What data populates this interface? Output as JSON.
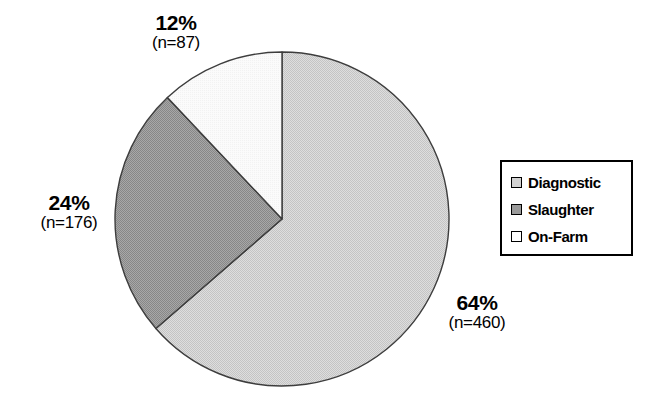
{
  "chart_data": {
    "type": "pie",
    "title": "",
    "categories": [
      "Diagnostic",
      "Slaughter",
      "On-Farm"
    ],
    "values": [
      460,
      176,
      87
    ],
    "percentages": [
      64,
      24,
      12
    ],
    "total": 723,
    "slice_colors": [
      "#d2d2d2",
      "#9a9a9a",
      "#ffffff"
    ],
    "slice_border_color": "#333333",
    "start_angle_deg": 0,
    "direction": "clockwise",
    "legend_position": "right",
    "grid": false,
    "xlabel": "",
    "ylabel": "",
    "data_labels": [
      {
        "key": "diagnostic",
        "pct": "64%",
        "count": "(n=460)"
      },
      {
        "key": "slaughter",
        "pct": "24%",
        "count": "(n=176)"
      },
      {
        "key": "onfarm",
        "pct": "12%",
        "count": "(n=87)"
      }
    ]
  },
  "labels": {
    "onfarm": {
      "pct": "12%",
      "count": "(n=87)"
    },
    "slaughter": {
      "pct": "24%",
      "count": "(n=176)"
    },
    "diagnostic": {
      "pct": "64%",
      "count": "(n=460)"
    }
  },
  "legend": {
    "items": [
      {
        "label": "Diagnostic",
        "color": "#d2d2d2"
      },
      {
        "label": "Slaughter",
        "color": "#9a9a9a"
      },
      {
        "label": "On-Farm",
        "color": "#ffffff"
      }
    ]
  }
}
